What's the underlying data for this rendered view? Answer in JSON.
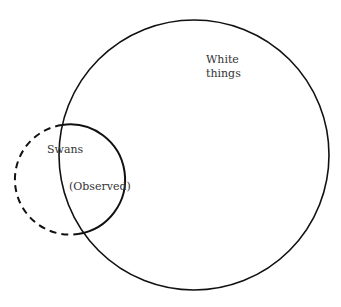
{
  "diagram": {
    "type": "venn",
    "sets": [
      {
        "id": "white-things",
        "label_lines": [
          "White",
          "things"
        ],
        "style": "solid"
      },
      {
        "id": "swans",
        "label": "Swans",
        "style": "dashed-outside, solid-inside"
      }
    ],
    "region_labels": {
      "observed": "(Observed)"
    }
  }
}
